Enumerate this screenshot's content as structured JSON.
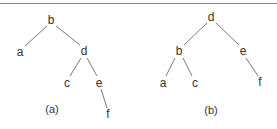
{
  "diagram": {
    "trees": [
      {
        "caption": "(a)",
        "nodes": [
          {
            "id": "b",
            "label": "b",
            "x": 51,
            "y": 20
          },
          {
            "id": "a",
            "label": "a",
            "x": 20,
            "y": 52
          },
          {
            "id": "d",
            "label": "d",
            "x": 84,
            "y": 51
          },
          {
            "id": "c",
            "label": "c",
            "x": 67,
            "y": 83
          },
          {
            "id": "e",
            "label": "e",
            "x": 99,
            "y": 83
          },
          {
            "id": "f",
            "label": "f",
            "x": 108,
            "y": 114
          }
        ],
        "edges": [
          [
            "b",
            "a"
          ],
          [
            "b",
            "d"
          ],
          [
            "d",
            "c"
          ],
          [
            "d",
            "e"
          ],
          [
            "e",
            "f"
          ]
        ]
      },
      {
        "caption": "(b)",
        "nodes": [
          {
            "id": "d",
            "label": "d",
            "x": 211,
            "y": 17
          },
          {
            "id": "b",
            "label": "b",
            "x": 179,
            "y": 51
          },
          {
            "id": "e",
            "label": "e",
            "x": 243,
            "y": 51
          },
          {
            "id": "a",
            "label": "a",
            "x": 163,
            "y": 83
          },
          {
            "id": "c",
            "label": "c",
            "x": 195,
            "y": 83
          },
          {
            "id": "f",
            "label": "f",
            "x": 260,
            "y": 82
          }
        ],
        "edges": [
          [
            "d",
            "b"
          ],
          [
            "d",
            "e"
          ],
          [
            "b",
            "a"
          ],
          [
            "b",
            "c"
          ],
          [
            "e",
            "f"
          ]
        ]
      }
    ]
  }
}
